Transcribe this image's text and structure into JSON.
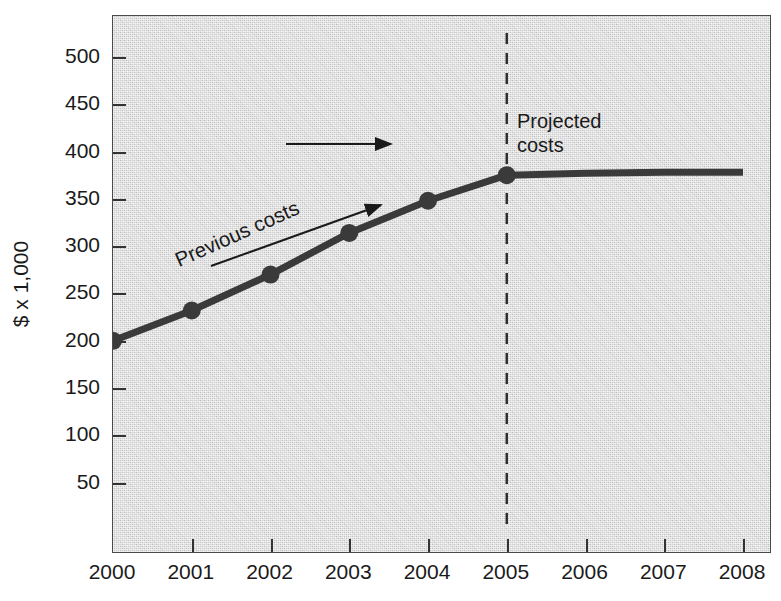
{
  "chart_data": {
    "type": "line",
    "title": "",
    "xlabel": "",
    "ylabel": "$ x 1,000",
    "x": [
      2000,
      2001,
      2002,
      2003,
      2004,
      2005,
      2006,
      2007,
      2008
    ],
    "categories": [
      "2000",
      "2001",
      "2002",
      "2003",
      "2004",
      "2005",
      "2006",
      "2007",
      "2008"
    ],
    "series": [
      {
        "name": "Previous costs",
        "values": [
          200,
          232,
          270,
          314,
          348,
          375,
          null,
          null,
          null
        ],
        "marker": "circle",
        "color": "#3a3a3a"
      },
      {
        "name": "Projected costs",
        "values": [
          null,
          null,
          null,
          null,
          null,
          375,
          377,
          378,
          378
        ],
        "marker": "none",
        "color": "#3a3a3a"
      }
    ],
    "xlim": [
      2000,
      2008
    ],
    "ylim": [
      0,
      520
    ],
    "yticks": [
      50,
      100,
      150,
      200,
      250,
      300,
      350,
      400,
      450,
      500
    ],
    "ytick_labels": [
      "50",
      "100",
      "150",
      "200",
      "250",
      "300",
      "350",
      "400",
      "450",
      "500"
    ],
    "xticks": [
      2000,
      2001,
      2002,
      2003,
      2004,
      2005,
      2006,
      2007,
      2008
    ],
    "xtick_labels": [
      "2000",
      "2001",
      "2002",
      "2003",
      "2004",
      "2005",
      "2006",
      "2007",
      "2008"
    ],
    "grid": false,
    "legend_position": "none",
    "plot_background": "#cfcfcf",
    "annotations": [
      {
        "id": "previous-costs",
        "text": "Previous costs",
        "rotation_deg": -24,
        "arrow": "diagonal-up-right"
      },
      {
        "id": "projected-costs",
        "line1": "Projected",
        "line2": "costs",
        "rotation_deg": 0,
        "arrow": "horizontal-right"
      }
    ],
    "divider": {
      "id": "projection-divider",
      "style": "dashed",
      "orientation": "vertical",
      "x_value": 2005
    }
  },
  "axis": {
    "y_title": "$ x 1,000"
  }
}
